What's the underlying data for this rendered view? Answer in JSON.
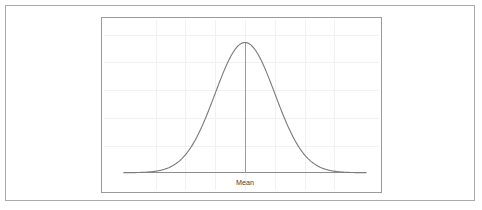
{
  "figure": {
    "background_color": "#ffffff",
    "frame": {
      "name": "outer-figure-border",
      "border_color": "#a9a9a9"
    },
    "panel": {
      "name": "chart-panel-border",
      "border_color": "#9a9a9a"
    }
  },
  "chart_data": {
    "type": "line",
    "title": "",
    "subtitle": "",
    "xlabel": "",
    "ylabel": "",
    "legend": [],
    "grid": true,
    "grid_color": "#f1f1f1",
    "curve_color": "#7d7d7d",
    "axis_color": "#8c8c8c",
    "annotations": [
      {
        "name": "mean-label",
        "text": "Mean",
        "x": 0,
        "y": 0,
        "position": "below-axis-center",
        "color": "#3c3c3c"
      },
      {
        "name": "mean-vertical-line",
        "text": "",
        "x": 0,
        "color": "#9b9b9b"
      }
    ],
    "xlim": [
      -4.05,
      4.05
    ],
    "ylim": [
      0,
      0.4224
    ],
    "x_gridlines": [
      -3,
      -2,
      -1,
      0,
      1,
      2,
      3
    ],
    "y_gridlines": [
      0.0845,
      0.169,
      0.2534,
      0.3379,
      0.4224
    ],
    "x_tick_labels": [
      "",
      "",
      "",
      "Mean",
      "",
      "",
      ""
    ],
    "y_tick_labels": [
      "",
      "",
      "",
      "",
      ""
    ],
    "series": [
      {
        "name": "normal-pdf",
        "mu": 0,
        "sigma": 1,
        "x": [
          -4.0,
          -3.8,
          -3.6,
          -3.4,
          -3.2,
          -3.0,
          -2.8,
          -2.6,
          -2.4,
          -2.2,
          -2.0,
          -1.8,
          -1.6,
          -1.4,
          -1.2,
          -1.0,
          -0.8,
          -0.6,
          -0.4,
          -0.2,
          0.0,
          0.2,
          0.4,
          0.6,
          0.8,
          1.0,
          1.2,
          1.4,
          1.6,
          1.8,
          2.0,
          2.2,
          2.4,
          2.6,
          2.8,
          3.0,
          3.2,
          3.4,
          3.6,
          3.8,
          4.0
        ],
        "values": [
          0.0001,
          0.0003,
          0.0006,
          0.0012,
          0.0024,
          0.0044,
          0.0079,
          0.0136,
          0.0224,
          0.0355,
          0.054,
          0.079,
          0.1109,
          0.1497,
          0.1942,
          0.242,
          0.2897,
          0.3332,
          0.3683,
          0.391,
          0.3989,
          0.391,
          0.3683,
          0.3332,
          0.2897,
          0.242,
          0.1942,
          0.1497,
          0.1109,
          0.079,
          0.054,
          0.0355,
          0.0224,
          0.0136,
          0.0079,
          0.0044,
          0.0024,
          0.0012,
          0.0006,
          0.0003,
          0.0001
        ]
      }
    ]
  }
}
